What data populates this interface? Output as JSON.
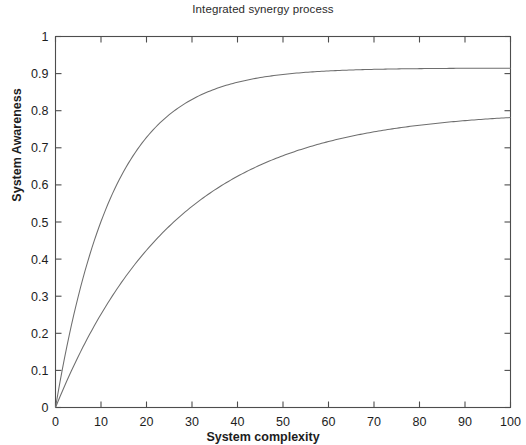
{
  "chart_data": {
    "type": "line",
    "title": "Integrated synergy process",
    "xlabel": "System complexity",
    "ylabel": "System Awareness",
    "xlim": [
      0,
      100
    ],
    "ylim": [
      0,
      1
    ],
    "grid": false,
    "legend": null,
    "xticks": [
      0,
      10,
      20,
      30,
      40,
      50,
      60,
      70,
      80,
      90,
      100
    ],
    "xticklabels": [
      "0",
      "10",
      "20",
      "30",
      "40",
      "50",
      "60",
      "70",
      "80",
      "90",
      "100"
    ],
    "yticks": [
      0,
      0.1,
      0.2,
      0.3,
      0.4,
      0.5,
      0.6,
      0.7,
      0.8,
      0.9,
      1
    ],
    "yticklabels": [
      "0",
      "0.1",
      "0.2",
      "0.3",
      "0.4",
      "0.5",
      "0.6",
      "0.7",
      "0.8",
      "0.9",
      "1"
    ],
    "line_color": "#6e6e6e",
    "axis_color": "#4d4d4d",
    "background": "#ffffff",
    "x": [
      0,
      2,
      4,
      6,
      8,
      10,
      12,
      14,
      16,
      18,
      20,
      22,
      24,
      26,
      28,
      30,
      32,
      34,
      36,
      38,
      40,
      42,
      44,
      46,
      48,
      50,
      52,
      54,
      56,
      58,
      60,
      62,
      64,
      66,
      68,
      70,
      72,
      74,
      76,
      78,
      80,
      82,
      84,
      86,
      88,
      90,
      92,
      94,
      96,
      98,
      100
    ],
    "series": [
      {
        "name": "upper curve",
        "values": [
          0,
          0.177,
          0.326,
          0.449,
          0.552,
          0.638,
          0.709,
          0.769,
          0.819,
          0.861,
          0.896,
          0.925,
          0.95,
          0.97,
          0.987,
          1.002,
          1.014,
          1.024,
          1.032,
          1.039,
          1.045,
          1.05,
          1.055,
          1.058,
          1.061,
          1.064,
          1.066,
          1.068,
          1.07,
          1.071,
          1.072,
          1.073,
          1.074,
          1.074,
          1.075,
          1.076,
          1.076,
          1.076,
          1.077,
          1.077,
          1.077,
          1.078,
          1.078,
          1.078,
          1.078,
          1.078,
          1.078,
          1.078,
          1.078,
          1.079,
          1.079
        ]
      },
      {
        "name": "lower curve",
        "values": [
          0,
          0.042,
          0.082,
          0.12,
          0.157,
          0.192,
          0.225,
          0.257,
          0.288,
          0.317,
          0.345,
          0.372,
          0.397,
          0.421,
          0.445,
          0.467,
          0.488,
          0.508,
          0.527,
          0.546,
          0.563,
          0.58,
          0.596,
          0.611,
          0.626,
          0.639,
          0.653,
          0.665,
          0.677,
          0.689,
          0.7,
          0.71,
          0.72,
          0.729,
          0.738,
          0.747,
          0.755,
          0.763,
          0.77,
          0.777,
          0.784,
          0.79,
          0.796,
          0.802,
          0.808,
          0.813,
          0.818,
          0.823,
          0.828,
          0.832,
          0.836
        ]
      }
    ],
    "series_display": [
      {
        "name": "upper curve",
        "model": "saturating exponential",
        "values_shown": [
          0,
          0.34,
          0.56,
          0.64,
          0.72,
          0.755,
          0.785,
          0.805,
          0.823,
          0.84,
          0.852,
          0.862,
          0.87,
          0.878,
          0.884,
          0.89,
          0.894,
          0.898,
          0.902,
          0.905,
          0.908,
          0.91
        ]
      },
      {
        "name": "lower curve",
        "model": "saturating exponential",
        "values_shown": [
          0,
          0.155,
          0.29,
          0.39,
          0.455,
          0.505,
          0.55,
          0.585,
          0.617,
          0.645,
          0.665,
          0.685,
          0.702,
          0.717,
          0.73,
          0.742,
          0.752,
          0.76,
          0.768,
          0.774,
          0.778,
          0.781
        ]
      }
    ]
  }
}
